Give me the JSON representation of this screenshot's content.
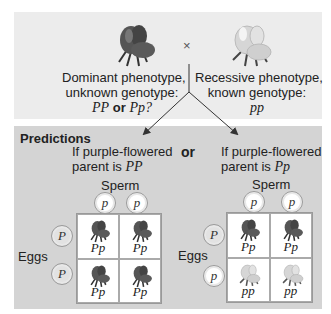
{
  "cross": {
    "symbol": "×",
    "dominant": {
      "line1": "Dominant phenotype,",
      "line2": "unknown genotype:",
      "genotype_a": "PP",
      "or": "or",
      "genotype_b": "Pp?",
      "flower_color": "purple"
    },
    "recessive": {
      "line1": "Recessive phenotype,",
      "line2": "known genotype:",
      "genotype": "pp",
      "flower_color": "white"
    }
  },
  "predictions": {
    "title": "Predictions",
    "or_label": "or",
    "left": {
      "line1": "If purple-flowered",
      "line2": "parent is",
      "genotype": "PP",
      "sperm_label": "Sperm",
      "eggs_label": "Eggs",
      "sperm": [
        "p",
        "p"
      ],
      "eggs": [
        "P",
        "P"
      ],
      "cells": [
        {
          "genotype": "Pp",
          "flower": "purple"
        },
        {
          "genotype": "Pp",
          "flower": "purple"
        },
        {
          "genotype": "Pp",
          "flower": "purple"
        },
        {
          "genotype": "Pp",
          "flower": "purple"
        }
      ]
    },
    "right": {
      "line1": "If purple-flowered",
      "line2": "parent is",
      "genotype": "Pp",
      "sperm_label": "Sperm",
      "eggs_label": "Eggs",
      "sperm": [
        "p",
        "p"
      ],
      "eggs": [
        "P",
        "p"
      ],
      "cells": [
        {
          "genotype": "Pp",
          "flower": "purple"
        },
        {
          "genotype": "Pp",
          "flower": "purple"
        },
        {
          "genotype": "pp",
          "flower": "white"
        },
        {
          "genotype": "pp",
          "flower": "white"
        }
      ]
    }
  },
  "colors": {
    "top_panel": "#ececec",
    "predictions_panel": "#d4d4d4",
    "dark_flower": "#4a4a4a",
    "light_flower": "#d9d9d9"
  }
}
